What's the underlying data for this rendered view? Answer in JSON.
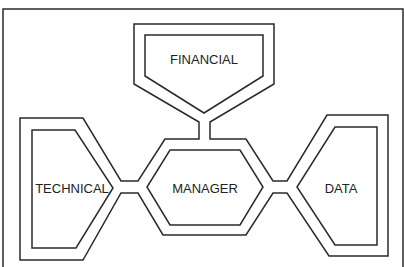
{
  "diagram": {
    "type": "node-connector diagram",
    "nodes": [
      {
        "id": "financial",
        "label": "FINANCIAL",
        "shape": "pentagon-down"
      },
      {
        "id": "technical",
        "label": "TECHNICAL",
        "shape": "pentagon-right"
      },
      {
        "id": "manager",
        "label": "MANAGER",
        "shape": "hexagon"
      },
      {
        "id": "data",
        "label": "DATA",
        "shape": "pentagon-left"
      }
    ],
    "connections": [
      {
        "from": "financial",
        "to": "manager"
      },
      {
        "from": "technical",
        "to": "manager"
      },
      {
        "from": "manager",
        "to": "data"
      }
    ],
    "colors": {
      "line": "#2a2a2a",
      "background": "#ffffff",
      "text": "#222222"
    }
  }
}
